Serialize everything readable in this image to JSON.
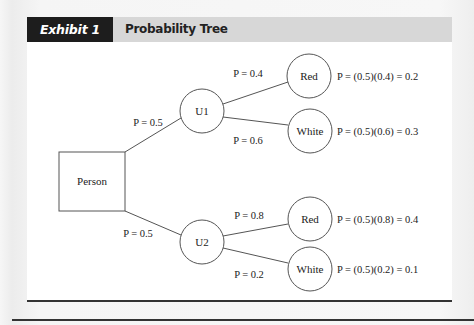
{
  "exhibit": {
    "label": "Exhibit 1",
    "title": "Probability Tree"
  },
  "colors": {
    "header_label_bg": "#1d1d1d",
    "header_title_bg": "#d7d7d7",
    "line": "#555555",
    "text": "#222222"
  },
  "tree": {
    "root": {
      "label": "Person",
      "shape": "rectangle"
    },
    "branches": [
      {
        "label": "P = 0.5",
        "node": "U1",
        "children": [
          {
            "label": "P = 0.4",
            "node": "Red",
            "outcome": "P = (0.5)(0.4) = 0.2"
          },
          {
            "label": "P = 0.6",
            "node": "White",
            "outcome": "P = (0.5)(0.6) = 0.3"
          }
        ]
      },
      {
        "label": "P = 0.5",
        "node": "U2",
        "children": [
          {
            "label": "P = 0.8",
            "node": "Red",
            "outcome": "P = (0.5)(0.8) = 0.4"
          },
          {
            "label": "P = 0.2",
            "node": "White",
            "outcome": "P = (0.5)(0.2) = 0.1"
          }
        ]
      }
    ]
  }
}
